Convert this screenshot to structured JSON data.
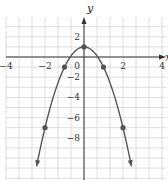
{
  "chart_data": {
    "type": "line",
    "title": "",
    "equation": "y = 1 - 2x^2",
    "xlabel": "x",
    "ylabel": "y",
    "xlim": [
      -6,
      6.5
    ],
    "ylim": [
      -9,
      3
    ],
    "grid": true,
    "x_ticks": [
      -4,
      -2,
      0,
      2,
      4
    ],
    "y_ticks": [
      2,
      -2,
      -4,
      -6,
      -8
    ],
    "x_tick_labels": [
      "−4",
      "−2",
      "0",
      "2",
      "4"
    ],
    "y_tick_labels": [
      "2",
      "−2",
      "−4",
      "−6",
      "−8"
    ],
    "points": [
      {
        "x": -2,
        "y": -7
      },
      {
        "x": -1,
        "y": -1
      },
      {
        "x": 0,
        "y": 1
      },
      {
        "x": 1,
        "y": -1
      },
      {
        "x": 2,
        "y": -7
      }
    ],
    "curve_ends_with_arrows": true
  },
  "colors": {
    "grid": "#d6d6d6",
    "axis": "#333333",
    "curve": "#555555",
    "point": "#555555"
  }
}
